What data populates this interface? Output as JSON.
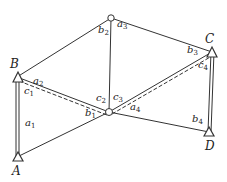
{
  "diagram": {
    "colors": {
      "line": "#333333",
      "text": "#222222",
      "background": "#ffffff"
    },
    "points": {
      "A": {
        "label": "A",
        "x": 17,
        "y": 157
      },
      "B": {
        "label": "B",
        "x": 17,
        "y": 77
      },
      "C": {
        "label": "C",
        "x": 212,
        "y": 52
      },
      "D": {
        "label": "D",
        "x": 209,
        "y": 132
      },
      "P1": {
        "label": "",
        "x": 109,
        "y": 112
      },
      "P2": {
        "label": "",
        "x": 111,
        "y": 18
      }
    },
    "angle_labels": [
      {
        "base": "a",
        "sub": "1",
        "x": 25,
        "y": 120
      },
      {
        "base": "b",
        "sub": "1",
        "x": 86,
        "y": 110
      },
      {
        "base": "a",
        "sub": "2",
        "x": 32,
        "y": 78
      },
      {
        "base": "c",
        "sub": "1",
        "x": 24,
        "y": 88
      },
      {
        "base": "b",
        "sub": "2",
        "x": 97,
        "y": 27
      },
      {
        "base": "a",
        "sub": "3",
        "x": 117,
        "y": 21
      },
      {
        "base": "c",
        "sub": "2",
        "x": 96,
        "y": 95
      },
      {
        "base": "c",
        "sub": "3",
        "x": 114,
        "y": 94
      },
      {
        "base": "a",
        "sub": "4",
        "x": 130,
        "y": 104
      },
      {
        "base": "b",
        "sub": "3",
        "x": 187,
        "y": 47
      },
      {
        "base": "c",
        "sub": "4",
        "x": 198,
        "y": 62
      },
      {
        "base": "b",
        "sub": "4",
        "x": 192,
        "y": 116
      }
    ]
  }
}
